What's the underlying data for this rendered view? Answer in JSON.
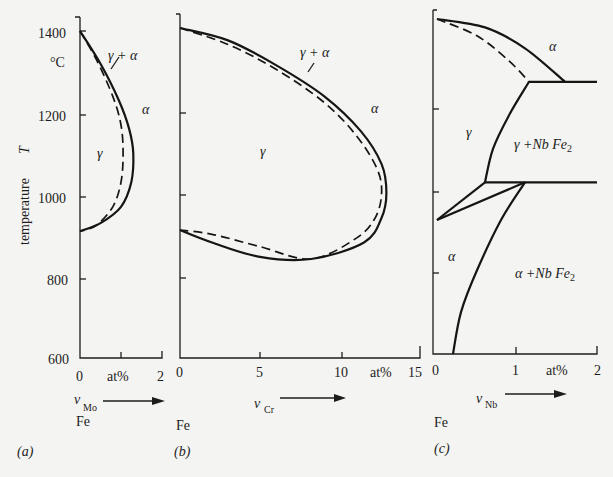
{
  "chart_data": [
    {
      "type": "line",
      "panel_label": "(a)",
      "title": "",
      "ylabel": "temperature T",
      "yunit": "°C",
      "xlabel": "ν_Mo",
      "xunit": "at%",
      "base_element": "Fe",
      "xlim": [
        0,
        2
      ],
      "ylim": [
        600,
        1400
      ],
      "xticks": [
        "0",
        "2"
      ],
      "yticks": [
        "600",
        "800",
        "1000",
        "1200",
        "1400"
      ],
      "grid": false,
      "regions": [
        "γ",
        "γ + α",
        "α"
      ],
      "series": [
        {
          "name": "γ/(γ+α) boundary",
          "style": "dashed",
          "points": [
            [
              0,
              1400
            ],
            [
              0.4,
              1330
            ],
            [
              0.8,
              1240
            ],
            [
              1.0,
              1170
            ],
            [
              1.05,
              1100
            ],
            [
              1.0,
              1030
            ],
            [
              0.8,
              970
            ],
            [
              0.4,
              925
            ],
            [
              0,
              910
            ]
          ]
        },
        {
          "name": "(γ+α)/α boundary",
          "style": "solid",
          "points": [
            [
              0,
              1400
            ],
            [
              0.5,
              1320
            ],
            [
              0.95,
              1230
            ],
            [
              1.2,
              1160
            ],
            [
              1.3,
              1100
            ],
            [
              1.25,
              1030
            ],
            [
              1.0,
              970
            ],
            [
              0.5,
              930
            ],
            [
              0,
              910
            ]
          ]
        }
      ]
    },
    {
      "type": "line",
      "panel_label": "(b)",
      "title": "",
      "xlabel": "ν_Cr",
      "xunit": "at%",
      "base_element": "Fe",
      "xlim": [
        0,
        15
      ],
      "ylim": [
        600,
        1400
      ],
      "xticks": [
        "0",
        "5",
        "10",
        "15"
      ],
      "grid": false,
      "regions": [
        "γ",
        "γ + α",
        "α"
      ],
      "series": [
        {
          "name": "γ/(γ+α) boundary",
          "style": "dashed",
          "points": [
            [
              0,
              1400
            ],
            [
              3,
              1360
            ],
            [
              6,
              1300
            ],
            [
              9,
              1220
            ],
            [
              11,
              1140
            ],
            [
              12.3,
              1060
            ],
            [
              12.6,
              1000
            ],
            [
              12.2,
              940
            ],
            [
              11,
              890
            ],
            [
              8.2,
              840
            ],
            [
              5,
              870
            ],
            [
              2,
              900
            ],
            [
              0,
              910
            ]
          ]
        },
        {
          "name": "(γ+α)/α boundary",
          "style": "solid",
          "points": [
            [
              0,
              1400
            ],
            [
              3,
              1370
            ],
            [
              6,
              1310
            ],
            [
              9,
              1235
            ],
            [
              11.3,
              1150
            ],
            [
              12.6,
              1070
            ],
            [
              12.9,
              1000
            ],
            [
              12.6,
              940
            ],
            [
              11.5,
              880
            ],
            [
              8.2,
              840
            ],
            [
              5,
              845
            ],
            [
              2,
              880
            ],
            [
              0,
              910
            ]
          ]
        }
      ]
    },
    {
      "type": "line",
      "panel_label": "(c)",
      "title": "",
      "xlabel": "ν_Nb",
      "xunit": "at%",
      "base_element": "Fe",
      "xlim": [
        0,
        2
      ],
      "ylim": [
        600,
        1400
      ],
      "xticks": [
        "0",
        "1",
        "2"
      ],
      "grid": false,
      "regions": [
        "γ",
        "α",
        "γ + Nb Fe₂",
        "α + Nb Fe₂"
      ],
      "series": [
        {
          "name": "upper γ/(γ+α) boundary",
          "style": "dashed",
          "points": [
            [
              0,
              1400
            ],
            [
              0.5,
              1360
            ],
            [
              0.9,
              1300
            ],
            [
              1.15,
              1250
            ]
          ]
        },
        {
          "name": "upper (γ+α)/α boundary",
          "style": "solid",
          "points": [
            [
              0,
              1400
            ],
            [
              0.6,
              1380
            ],
            [
              1.1,
              1330
            ],
            [
              1.6,
              1250
            ]
          ]
        },
        {
          "name": "eutectoid line 1250",
          "style": "solid",
          "points": [
            [
              1.15,
              1250
            ],
            [
              2.0,
              1250
            ]
          ]
        },
        {
          "name": "γ solvus",
          "style": "solid",
          "points": [
            [
              1.15,
              1250
            ],
            [
              0.9,
              1170
            ],
            [
              0.7,
              1090
            ],
            [
              0.6,
              1010
            ]
          ]
        },
        {
          "name": "eutectoid line 1010",
          "style": "solid",
          "points": [
            [
              0.6,
              1010
            ],
            [
              2.0,
              1010
            ]
          ]
        },
        {
          "name": "lower γ/(γ+α) boundary",
          "style": "solid",
          "points": [
            [
              0,
              920
            ],
            [
              0.6,
              1010
            ]
          ]
        },
        {
          "name": "lower (γ+α)/α boundary",
          "style": "solid",
          "points": [
            [
              0,
              920
            ],
            [
              1.1,
              1010
            ]
          ]
        },
        {
          "name": "α solvus",
          "style": "solid",
          "points": [
            [
              1.1,
              1010
            ],
            [
              0.8,
              920
            ],
            [
              0.5,
              800
            ],
            [
              0.3,
              700
            ],
            [
              0.2,
              600
            ]
          ]
        }
      ]
    }
  ],
  "labels": {
    "ylabel": "temperature",
    "ylabel_var": "T",
    "yunit": "°C",
    "at_pct": "at%",
    "fe": "Fe",
    "nu": "ν",
    "sub_mo": "Mo",
    "sub_cr": "Cr",
    "sub_nb": "Nb",
    "panel_a": "(a)",
    "panel_b": "(b)",
    "panel_c": "(c)",
    "gamma": "γ",
    "alpha": "α",
    "gamma_alpha": "γ + α",
    "gamma_nbfe2": "γ +Nb Fe",
    "alpha_nbfe2": "α +Nb Fe",
    "two": "2"
  }
}
